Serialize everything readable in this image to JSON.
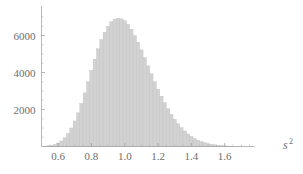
{
  "chart_data": {
    "type": "bar",
    "title": "",
    "subtitle": "",
    "xlabel": "s^2",
    "xlabel_base": "s",
    "xlabel_exponent": "2",
    "ylabel": "",
    "xlim": [
      0.5,
      1.78
    ],
    "ylim": [
      0,
      7600
    ],
    "grid": false,
    "legend": null,
    "bin_width": 0.02,
    "xticks": [
      0.6,
      0.8,
      1.0,
      1.2,
      1.4,
      1.6
    ],
    "xtick_labels": [
      "0.6",
      "0.8",
      "1.0",
      "1.2",
      "1.4",
      "1.6"
    ],
    "xticks_minor": [
      0.55,
      0.65,
      0.7,
      0.75,
      0.85,
      0.9,
      0.95,
      1.05,
      1.1,
      1.15,
      1.25,
      1.3,
      1.35,
      1.45,
      1.5,
      1.55,
      1.65,
      1.7,
      1.75
    ],
    "yticks": [
      2000,
      4000,
      6000
    ],
    "ytick_labels": [
      "2000",
      "4000",
      "6000"
    ],
    "yticks_minor": [
      500,
      1000,
      1500,
      2500,
      3000,
      3500,
      4500,
      5000,
      5500,
      6500,
      7000
    ],
    "bar_color": "#d2d2d2",
    "bar_edge_color": "#bdbdbd",
    "axis_color": "#9a9a9a",
    "text_color": "#6e6e6e",
    "categories": [
      0.52,
      0.54,
      0.56,
      0.58,
      0.6,
      0.62,
      0.64,
      0.66,
      0.68,
      0.7,
      0.72,
      0.74,
      0.76,
      0.78,
      0.8,
      0.82,
      0.84,
      0.86,
      0.88,
      0.9,
      0.92,
      0.94,
      0.96,
      0.98,
      1.0,
      1.02,
      1.04,
      1.06,
      1.08,
      1.1,
      1.12,
      1.14,
      1.16,
      1.18,
      1.2,
      1.22,
      1.24,
      1.26,
      1.28,
      1.3,
      1.32,
      1.34,
      1.36,
      1.38,
      1.4,
      1.42,
      1.44,
      1.46,
      1.48,
      1.5,
      1.52,
      1.54,
      1.56,
      1.58,
      1.6,
      1.62,
      1.64
    ],
    "values": [
      20,
      35,
      60,
      110,
      190,
      300,
      470,
      700,
      1000,
      1380,
      1820,
      2330,
      2900,
      3500,
      4120,
      4720,
      5280,
      5780,
      6180,
      6500,
      6750,
      6880,
      6930,
      6900,
      6800,
      6600,
      6330,
      6000,
      5630,
      5220,
      4800,
      4360,
      3930,
      3500,
      3100,
      2720,
      2370,
      2040,
      1740,
      1470,
      1230,
      1020,
      840,
      680,
      545,
      430,
      340,
      265,
      205,
      155,
      118,
      88,
      65,
      48,
      34,
      24,
      16
    ]
  }
}
